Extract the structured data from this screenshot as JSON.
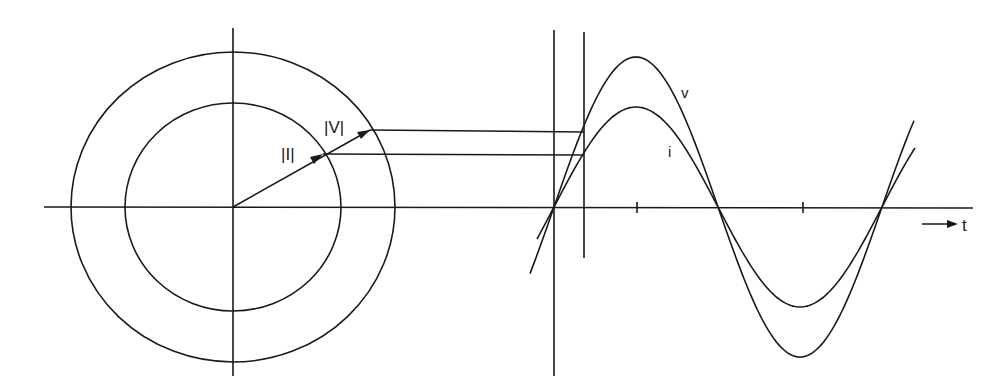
{
  "diagram": {
    "title": "",
    "phasor": {
      "center": [
        233,
        207
      ],
      "outer_circle": {
        "rx": 162,
        "ry": 155
      },
      "inner_circle": {
        "rx": 108,
        "ry": 104
      },
      "voltage_tip": [
        370,
        130
      ],
      "current_tip": [
        323,
        154
      ],
      "voltage_label": "|V|",
      "current_label": "|I|"
    },
    "waveform": {
      "voltage_label": "v",
      "current_label": "i",
      "time_axis_label": "t",
      "zero_x": 554,
      "half_period_px": 164,
      "baseline_y": 207,
      "voltage_amplitude_px": 150,
      "current_amplitude_px": 100,
      "marker_x": 584,
      "tick_positions": [
        637,
        803
      ]
    },
    "colors": {
      "ink": "#1a1a1a",
      "background": "#ffffff"
    }
  }
}
